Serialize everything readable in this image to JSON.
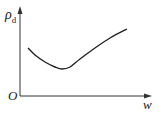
{
  "chart_data": {
    "type": "line",
    "title": "",
    "xlabel": "w",
    "ylabel": "ρd",
    "ylabel_main": "ρ",
    "ylabel_sub": "d",
    "origin_label": "O",
    "grid": false,
    "legend": null,
    "series": [
      {
        "name": "ρd vs w",
        "description": "dry density first decreases with water content to a minimum, then increases",
        "points_px": [
          [
            28,
            48
          ],
          [
            35,
            55
          ],
          [
            45,
            62
          ],
          [
            55,
            67
          ],
          [
            62,
            69
          ],
          [
            70,
            67
          ],
          [
            80,
            59
          ],
          [
            95,
            48
          ],
          [
            110,
            38
          ],
          [
            127,
            29
          ]
        ]
      }
    ],
    "axis_ticks": {
      "x": [],
      "y": []
    }
  },
  "colors": {
    "axis": "#333333",
    "curve": "#222222",
    "background": "#ffffff"
  }
}
